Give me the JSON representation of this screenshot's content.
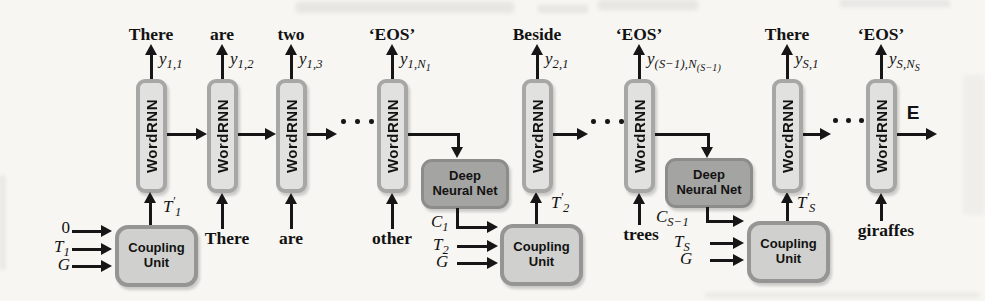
{
  "colors": {
    "background": "#f7f6f3",
    "arrow": "#161616",
    "text": "#121212",
    "rnn-fill": "#e1e1df",
    "rnn-border": "#a7a7a5",
    "dnn-fill": "#a4a4a2",
    "dnn-border": "#8c8c8a",
    "cu-fill": "#d0d0ce",
    "cu-border": "#959593"
  },
  "rnn_label": "WordRNN",
  "dnn_label": {
    "line1": "Deep",
    "line2": "Neural Net"
  },
  "cu_label": {
    "line1": "Coupling",
    "line2": "Unit"
  },
  "end_label": "E",
  "top": [
    {
      "word": "There",
      "y": {
        "b": "y",
        "s": "1,1"
      }
    },
    {
      "word": "are",
      "y": {
        "b": "y",
        "s": "1,2"
      }
    },
    {
      "word": "two",
      "y": {
        "b": "y",
        "s": "1,3"
      }
    },
    {
      "word": "‘EOS’",
      "y": {
        "b": "y",
        "s": "1,N",
        "ss": "1"
      }
    },
    {
      "word": "Beside",
      "y": {
        "b": "y",
        "s": "2,1"
      }
    },
    {
      "word": "‘EOS’",
      "y": {
        "b": "y",
        "s": "(S−1),N",
        "ss": "(S−1)"
      }
    },
    {
      "word": "There",
      "y": {
        "b": "y",
        "s": "S,1"
      }
    },
    {
      "word": "‘EOS’",
      "y": {
        "b": "y",
        "s": "S,N",
        "ss": "S"
      }
    }
  ],
  "bottom": {
    "b2": "There",
    "b3": "are",
    "b4": "other",
    "b6": "trees",
    "b8": "giraffes"
  },
  "cu1": {
    "in1": {
      "b": "0"
    },
    "in2": {
      "b": "T",
      "s": "1"
    },
    "in3": {
      "b": "G"
    },
    "out": {
      "b": "T",
      "p": "′",
      "s": "1"
    }
  },
  "cu2": {
    "in2": {
      "b": "T",
      "s": "2"
    },
    "in3": {
      "b": "G"
    },
    "out": {
      "b": "T",
      "p": "′",
      "s": "2"
    }
  },
  "cu3": {
    "in2": {
      "b": "T",
      "s": "S"
    },
    "in3": {
      "b": "G"
    },
    "out": {
      "b": "T",
      "p": "′",
      "s": "S"
    }
  },
  "dnn1_out": {
    "b": "C",
    "s": "1"
  },
  "dnn2_out": {
    "b": "C",
    "s": "S−1"
  }
}
